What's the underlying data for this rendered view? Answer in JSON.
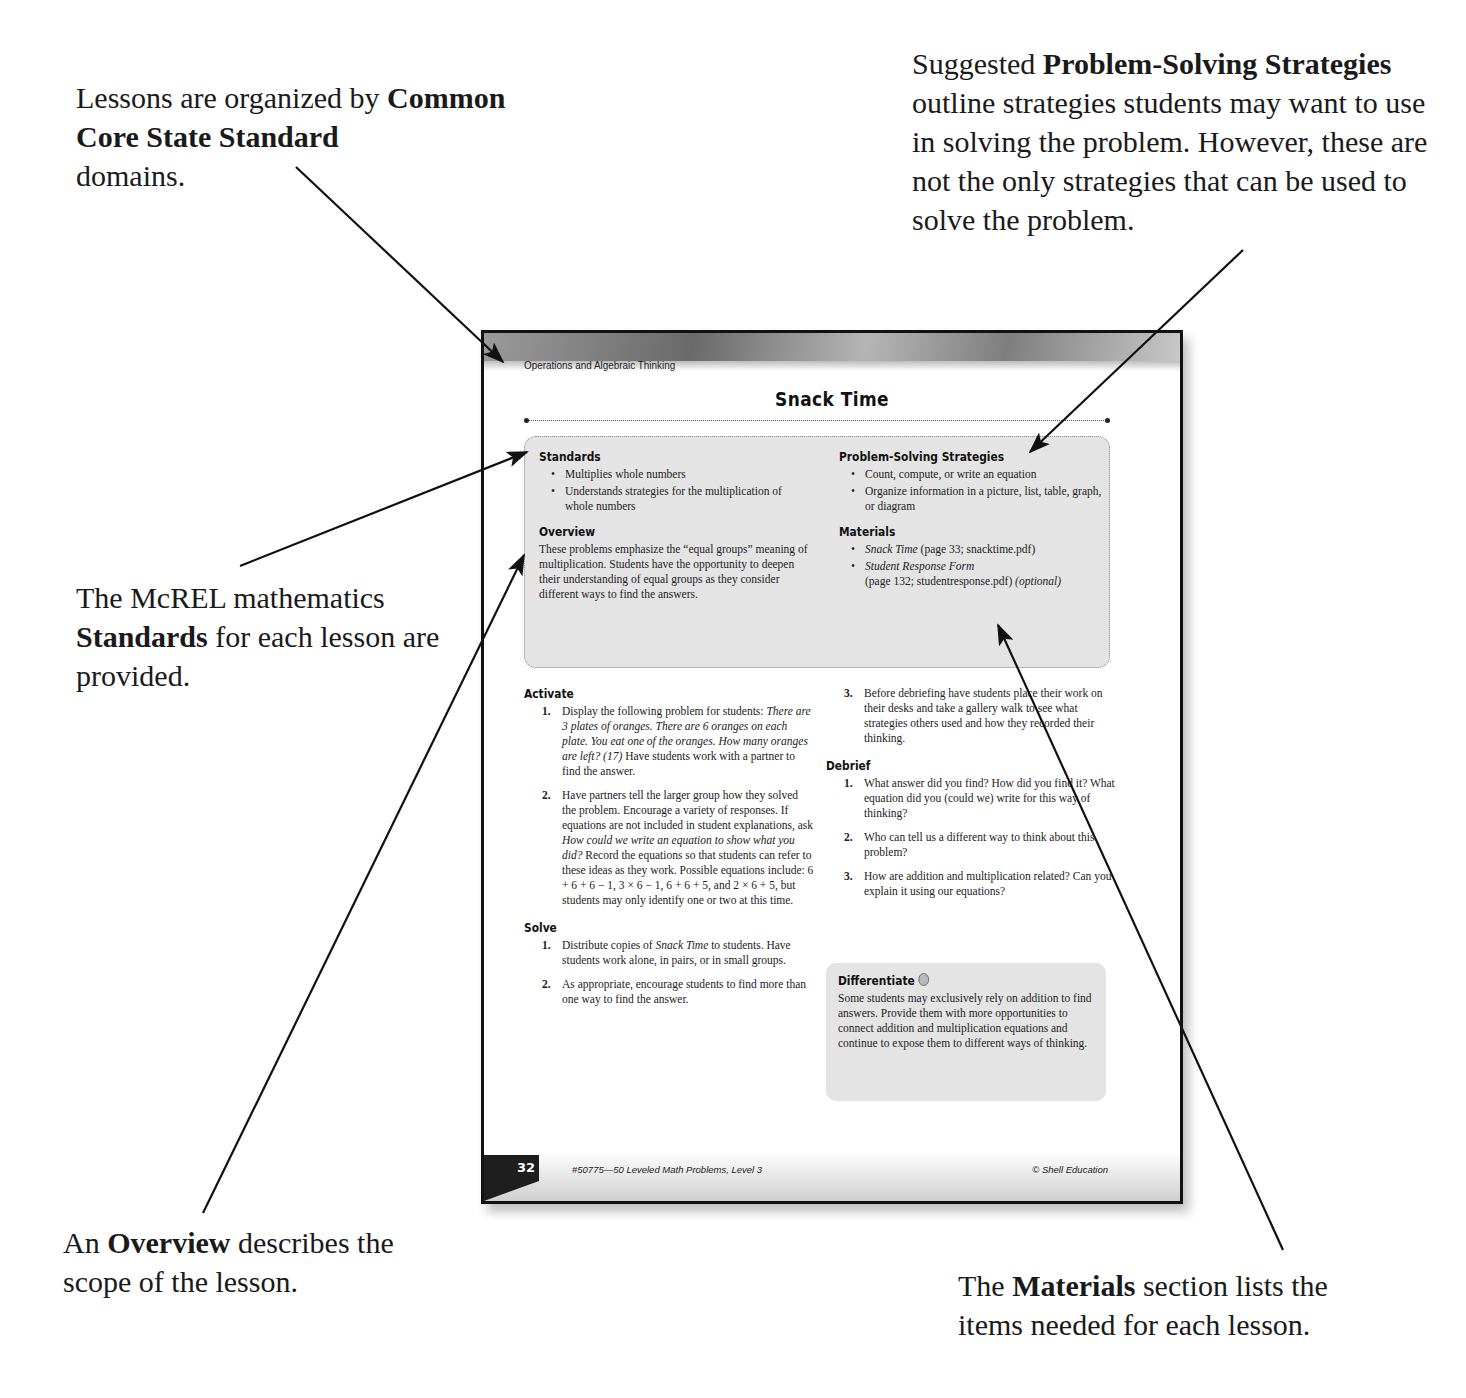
{
  "callouts": {
    "domains": {
      "pre": "Lessons are organized by ",
      "bold": "Common Core State Standard",
      "post": " domains."
    },
    "strategies": {
      "pre": "Suggested ",
      "bold": "Problem-Solving Strategies",
      "post": " outline strategies students may want to use in solving the problem. However, these are not the only strategies that can be used to solve the problem."
    },
    "standards": {
      "pre": "The McREL mathematics ",
      "bold": "Standards",
      "post": " for each lesson are provided."
    },
    "overview": {
      "pre": "An ",
      "bold": "Overview",
      "post": " describes the scope of the lesson."
    },
    "materials": {
      "pre": "The ",
      "bold": "Materials",
      "post": " section lists the items needed for each lesson."
    }
  },
  "page": {
    "domain": "Operations and Algebraic Thinking",
    "title": "Snack Time",
    "standards": {
      "heading": "Standards",
      "items": [
        "Multiplies whole numbers",
        "Understands strategies for the multiplication of whole numbers"
      ]
    },
    "overview": {
      "heading": "Overview",
      "text": "These problems emphasize the “equal groups” meaning of multiplication. Students have the opportunity to deepen their understanding of equal groups as they consider different ways to find the answers."
    },
    "strategies": {
      "heading": "Problem-Solving Strategies",
      "items": [
        "Count, compute, or write an equation",
        "Organize information in a picture, list, table, graph, or diagram"
      ]
    },
    "materials": {
      "heading": "Materials",
      "items": [
        {
          "italic": "Snack Time",
          "rest": " (page 33; snacktime.pdf)",
          "note": ""
        },
        {
          "italic": "Student Response Form",
          "rest": " (page 132; studentresponse.pdf) ",
          "note": "(optional)"
        }
      ]
    },
    "activate": {
      "heading": "Activate",
      "items": [
        {
          "n": "1.",
          "pre": "Display the following problem for students: ",
          "italic": "There are 3 plates of oranges. There are 6 oranges on each plate. You eat one of the oranges. How many oranges are left? (17)",
          "post": " Have students work with a partner to find the answer."
        },
        {
          "n": "2.",
          "pre": "Have partners tell the larger group how they solved the problem. Encourage a variety of responses. If equations are not included in student explanations, ask ",
          "italic": "How could we write an equation to show what you did?",
          "post": " Record the equations so that students can refer to these ideas as they work. Possible equations include: 6 + 6 + 6 − 1, 3 × 6 − 1, 6 + 6 + 5, and 2 × 6 + 5, but students may only identify one or two at this time."
        }
      ]
    },
    "solve": {
      "heading": "Solve",
      "items": [
        {
          "n": "1.",
          "pre": "Distribute copies of ",
          "italic": "Snack Time",
          "post": " to students. Have students work alone, in pairs, or in small groups."
        },
        {
          "n": "2.",
          "pre": "As appropriate, encourage students to find more than one way to find the answer.",
          "italic": "",
          "post": ""
        },
        {
          "n": "3.",
          "pre": "Before debriefing have students place their work on their desks and take a gallery walk to see what strategies others used and how they recorded their thinking.",
          "italic": "",
          "post": ""
        }
      ]
    },
    "debrief": {
      "heading": "Debrief",
      "items": [
        {
          "n": "1.",
          "text": "What answer did you find? How did you find it? What equation did you (could we) write for this way of thinking?"
        },
        {
          "n": "2.",
          "text": "Who can tell us a different way to think about this problem?"
        },
        {
          "n": "3.",
          "text": "How are addition and multiplication related? Can you explain it using our equations?"
        }
      ]
    },
    "differentiate": {
      "heading": "Differentiate",
      "icon": "gray-circle-icon",
      "text": "Some students may exclusively rely on addition to find answers. Provide them with more opportunities to connect addition and multiplication equations and continue to expose them to different ways of thinking."
    },
    "footer": {
      "page_number": "32",
      "book_title": "#50775—50 Leveled Math Problems, Level 3",
      "copyright": "© Shell Education"
    }
  }
}
